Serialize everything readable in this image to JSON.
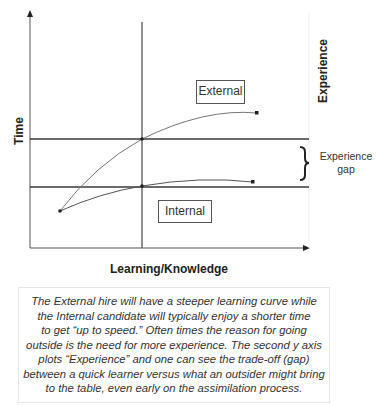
{
  "diagram": {
    "y_axis_left": {
      "label": "Time"
    },
    "y_axis_right": {
      "label": "Experience"
    },
    "x_axis": {
      "label": "Learning/Knowledge"
    },
    "curves": [
      {
        "name": "External",
        "label": "External",
        "start": [
          60,
          211
        ],
        "through": [
          142,
          139
        ],
        "end": [
          257,
          113
        ]
      },
      {
        "name": "Internal",
        "label": "Internal",
        "start": [
          60,
          211
        ],
        "through": [
          142,
          186
        ],
        "end": [
          253,
          182
        ]
      }
    ],
    "gap": {
      "label_line1": "Experience",
      "label_line2": "gap"
    },
    "colors": {
      "axis": "#555555",
      "curve": "#777777",
      "bold_line": "#3a3a3a",
      "text": "#222222"
    }
  },
  "caption": {
    "lines": [
      "The External hire will have a steeper learning curve while",
      "the Internal candidate will typically enjoy a shorter time",
      "to get “up to speed.” Often times the reason for going",
      "outside is the need for more experience. The second y axis",
      "plots “Experience” and one can see the trade-off (gap)",
      "between a quick learner versus what an outsider might bring",
      "to the table, even early on the assimilation process."
    ]
  }
}
